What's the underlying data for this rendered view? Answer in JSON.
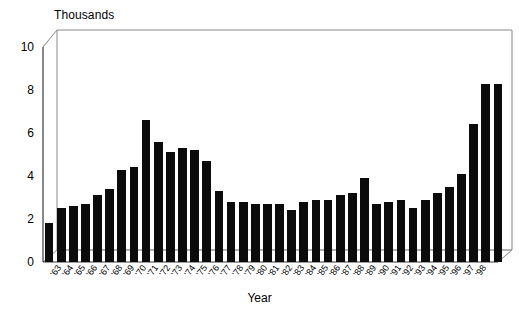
{
  "chart_data": {
    "type": "bar",
    "title": "",
    "subtitle": "",
    "xlabel": "Year",
    "ylabel": "Thousands",
    "ylim": [
      0,
      10
    ],
    "yticks": [
      0,
      2,
      4,
      6,
      8,
      10
    ],
    "grid": false,
    "legend": null,
    "style": "3d-column",
    "bar_color": "#0b0b0b",
    "categories": [
      "63",
      "64",
      "65",
      "66",
      "67",
      "68",
      "69",
      "70",
      "71",
      "72",
      "73",
      "74",
      "75",
      "76",
      "77",
      "78",
      "79",
      "80",
      "81",
      "82",
      "83",
      "84",
      "85",
      "86",
      "87",
      "88",
      "89",
      "90",
      "91",
      "92",
      "93",
      "94",
      "95",
      "96",
      "97",
      "98"
    ],
    "values": [
      1.8,
      2.5,
      2.6,
      2.7,
      3.1,
      3.4,
      4.3,
      4.4,
      6.6,
      5.6,
      5.1,
      5.3,
      5.2,
      4.7,
      3.3,
      2.8,
      2.8,
      2.7,
      2.7,
      2.7,
      2.4,
      2.8,
      2.9,
      2.9,
      3.1,
      3.2,
      3.9,
      2.7,
      2.8,
      2.9,
      2.5,
      2.9,
      3.2,
      3.5,
      4.1,
      6.4
    ],
    "extra_values": [
      8.3,
      8.3
    ],
    "series_name": "Count",
    "units": "Thousands"
  },
  "axis": {
    "y_title": "Thousands",
    "x_title": "Year"
  }
}
